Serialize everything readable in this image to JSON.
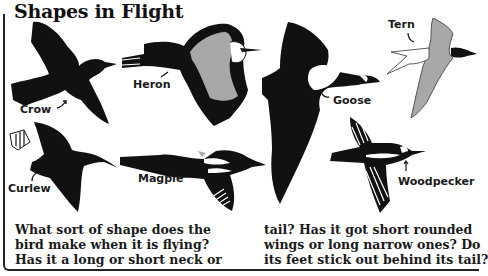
{
  "page": {
    "title": "Shapes in Flight"
  },
  "birds": [
    {
      "name": "Crow",
      "fill": "#111111"
    },
    {
      "name": "Heron",
      "fill": "#111111",
      "accent": "#a8a8a8"
    },
    {
      "name": "Goose",
      "fill": "#111111"
    },
    {
      "name": "Tern",
      "fill": "#a8a8a8"
    },
    {
      "name": "Curlew",
      "fill": "#111111"
    },
    {
      "name": "Magpie",
      "fill": "#111111"
    },
    {
      "name": "Woodpecker",
      "fill": "#111111"
    }
  ],
  "text": {
    "column_left": "What sort of shape does the\nbird make when it is flying?\nHas it a long or short neck or",
    "column_right": "tail? Has it got short rounded\nwings or long narrow ones? Do\nits feet stick out behind its tail?"
  },
  "colors": {
    "ink": "#111111",
    "grey": "#a8a8a8",
    "paper": "#ffffff"
  }
}
